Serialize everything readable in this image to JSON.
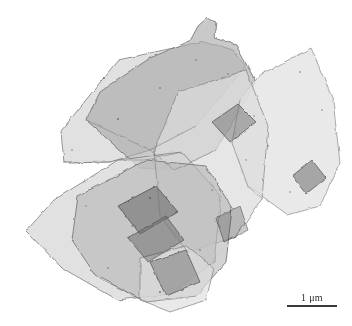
{
  "figure": {
    "kind": "electron-micrograph",
    "modality": "transmission-electron-microscopy",
    "width": 352,
    "height": 326,
    "background_color": "#ffffff"
  },
  "scalebar": {
    "label": "1 μm",
    "bar_length_px": 50,
    "line_color": "#3a3a3a",
    "text_color": "#2b2b2b",
    "position": "bottom-right"
  },
  "palette": {
    "background": "#ffffff",
    "flake_light": "#d9d9d9",
    "flake_mid": "#c0c0c0",
    "flake_dark": "#a3a3a3",
    "flake_darkest": "#8a8a8a",
    "edge_line": "#5a5a5a",
    "speckle": "#6f6f6f"
  },
  "chart_data": {
    "type": "scatter",
    "title": "",
    "xlabel": "",
    "ylabel": "",
    "note": "image-domain figure; geometry below describes the depicted flakes",
    "flakes": [
      {
        "id": "flake-upper-left",
        "tone": "#d6d6d6",
        "opacity": 0.55,
        "points": [
          [
            64,
            163
          ],
          [
            61,
            131
          ],
          [
            118,
            60
          ],
          [
            187,
            45
          ],
          [
            204,
            41
          ],
          [
            233,
            50
          ],
          [
            246,
            66
          ],
          [
            196,
            126
          ],
          [
            150,
            150
          ],
          [
            110,
            162
          ]
        ]
      },
      {
        "id": "flake-upper-center-dark",
        "tone": "#a8a8a8",
        "opacity": 0.55,
        "points": [
          [
            190,
            41
          ],
          [
            198,
            26
          ],
          [
            207,
            18
          ],
          [
            216,
            22
          ],
          [
            214,
            38
          ],
          [
            236,
            45
          ],
          [
            256,
            82
          ],
          [
            216,
            150
          ],
          [
            174,
            170
          ],
          [
            140,
            168
          ],
          [
            86,
            120
          ],
          [
            100,
            92
          ],
          [
            150,
            58
          ]
        ]
      },
      {
        "id": "flake-upper-right",
        "tone": "#e3e3e3",
        "opacity": 0.5,
        "points": [
          [
            240,
            100
          ],
          [
            258,
            76
          ],
          [
            311,
            48
          ],
          [
            333,
            100
          ],
          [
            340,
            163
          ],
          [
            320,
            206
          ],
          [
            288,
            215
          ],
          [
            248,
            186
          ],
          [
            232,
            143
          ]
        ]
      },
      {
        "id": "flake-center-right",
        "tone": "#dcdcdc",
        "opacity": 0.5,
        "points": [
          [
            178,
            92
          ],
          [
            246,
            70
          ],
          [
            268,
            126
          ],
          [
            262,
            199
          ],
          [
            236,
            237
          ],
          [
            188,
            252
          ],
          [
            160,
            216
          ],
          [
            154,
            150
          ]
        ]
      },
      {
        "id": "flake-lower-left",
        "tone": "#d4d4d4",
        "opacity": 0.55,
        "points": [
          [
            26,
            231
          ],
          [
            54,
            200
          ],
          [
            118,
            160
          ],
          [
            182,
            152
          ],
          [
            221,
            196
          ],
          [
            214,
            262
          ],
          [
            170,
            294
          ],
          [
            118,
            300
          ],
          [
            62,
            268
          ]
        ]
      },
      {
        "id": "flake-lower-center",
        "tone": "#b6b6b6",
        "opacity": 0.55,
        "points": [
          [
            78,
            196
          ],
          [
            146,
            160
          ],
          [
            206,
            166
          ],
          [
            232,
            208
          ],
          [
            226,
            262
          ],
          [
            196,
            296
          ],
          [
            146,
            302
          ],
          [
            96,
            276
          ],
          [
            72,
            240
          ]
        ]
      },
      {
        "id": "flake-bottom-tail",
        "tone": "#dddddd",
        "opacity": 0.5,
        "points": [
          [
            140,
            258
          ],
          [
            186,
            246
          ],
          [
            214,
            268
          ],
          [
            206,
            300
          ],
          [
            170,
            312
          ],
          [
            140,
            300
          ]
        ]
      }
    ],
    "inclusions": [
      {
        "id": "inclusion-upper-right",
        "tone": "#9a9a9a",
        "points": [
          [
            212,
            122
          ],
          [
            238,
            104
          ],
          [
            256,
            122
          ],
          [
            230,
            142
          ]
        ]
      },
      {
        "id": "inclusion-right-lower",
        "tone": "#8f8f8f",
        "points": [
          [
            292,
            176
          ],
          [
            312,
            160
          ],
          [
            326,
            178
          ],
          [
            306,
            194
          ]
        ]
      },
      {
        "id": "inclusion-center",
        "tone": "#8c8c8c",
        "points": [
          [
            118,
            206
          ],
          [
            156,
            186
          ],
          [
            178,
            212
          ],
          [
            140,
            234
          ]
        ]
      },
      {
        "id": "inclusion-center-low",
        "tone": "#909090",
        "points": [
          [
            128,
            238
          ],
          [
            166,
            216
          ],
          [
            184,
            240
          ],
          [
            148,
            262
          ]
        ]
      },
      {
        "id": "inclusion-bottom",
        "tone": "#9c9c9c",
        "points": [
          [
            150,
            262
          ],
          [
            186,
            250
          ],
          [
            200,
            282
          ],
          [
            166,
            296
          ]
        ]
      },
      {
        "id": "inclusion-mid-right",
        "tone": "#a0a0a0",
        "points": [
          [
            216,
            218
          ],
          [
            240,
            206
          ],
          [
            248,
            230
          ],
          [
            224,
            242
          ]
        ]
      }
    ]
  }
}
